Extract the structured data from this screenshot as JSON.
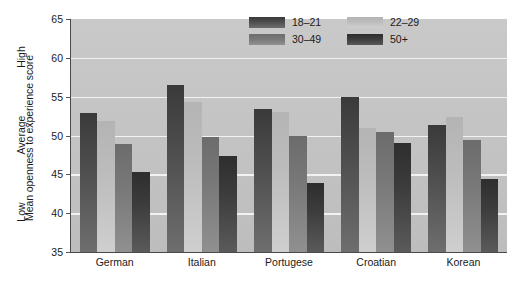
{
  "chart_data": {
    "type": "bar",
    "title": "",
    "subtitle": "",
    "xlabel": "",
    "ylabel": "Mean openness to experience score",
    "ylim": [
      35,
      65
    ],
    "yticks": [
      35,
      40,
      45,
      50,
      55,
      60,
      65
    ],
    "ytick_labels": [
      "35",
      "40",
      "45",
      "50",
      "55",
      "60",
      "65"
    ],
    "y_qualitative_labels": [
      {
        "text": "High",
        "value": 60
      },
      {
        "text": "Average",
        "value": 50
      },
      {
        "text": "Low",
        "value": 40
      }
    ],
    "grid": true,
    "grid_axis": "y",
    "legend_position": "top-right",
    "categories": [
      "German",
      "Italian",
      "Portugese",
      "Croatian",
      "Korean"
    ],
    "series": [
      {
        "name": "18–21",
        "color": "#4e4e4e",
        "values": [
          52.9,
          56.5,
          53.4,
          55.0,
          51.4
        ]
      },
      {
        "name": "22–29",
        "color": "#bcbcbc",
        "values": [
          51.9,
          54.3,
          53.0,
          51.0,
          52.4
        ]
      },
      {
        "name": "30–49",
        "color": "#787878",
        "values": [
          48.9,
          49.8,
          49.9,
          50.5,
          49.4
        ]
      },
      {
        "name": "50+",
        "color": "#3c3c3c",
        "values": [
          45.3,
          47.3,
          43.9,
          49.0,
          44.4
        ]
      }
    ]
  },
  "legend": {
    "items": [
      {
        "label": "18–21"
      },
      {
        "label": "22–29"
      },
      {
        "label": "30–49"
      },
      {
        "label": "50+"
      }
    ]
  },
  "caption": {
    "text": ""
  }
}
